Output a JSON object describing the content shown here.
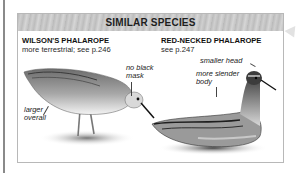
{
  "panel": {
    "title": "SIMILAR SPECIES"
  },
  "species": [
    {
      "name": "WILSON'S PHALAROPE",
      "note": "more terrestrial; see p.246",
      "annotations": [
        "no black mask",
        "larger overall"
      ],
      "annotation_lines": {
        "mask_1": "no black",
        "mask_2": "mask",
        "larger_1": "larger",
        "larger_2": "overall"
      },
      "illustration": "wilsons-phalarope-illustration"
    },
    {
      "name": "RED-NECKED PHALAROPE",
      "note": "see p.247",
      "annotations": [
        "smaller head",
        "more slender body"
      ],
      "annotation_lines": {
        "head": "smaller head",
        "slender_1": "more slender",
        "slender_2": "body"
      },
      "illustration": "red-necked-phalarope-illustration"
    }
  ],
  "colors": {
    "header_bg": "#c4c4c4",
    "border": "#b8b8b8",
    "text": "#111111",
    "left_rule": "#8a8a8a"
  }
}
